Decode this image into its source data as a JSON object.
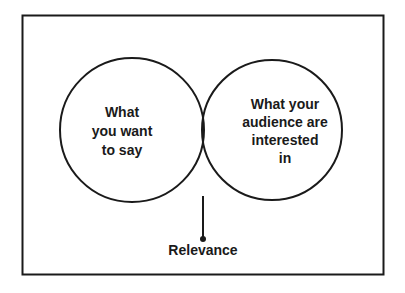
{
  "diagram": {
    "type": "venn",
    "left_circle": {
      "lines": [
        "What",
        "you want",
        "to say"
      ]
    },
    "right_circle": {
      "lines": [
        "What your",
        "audience are",
        "interested",
        "in"
      ]
    },
    "intersection_label": "Relevance",
    "colors": {
      "stroke": "#1a1a1a",
      "intersection_fill": "#b3b3b3",
      "background": "#ffffff"
    }
  }
}
